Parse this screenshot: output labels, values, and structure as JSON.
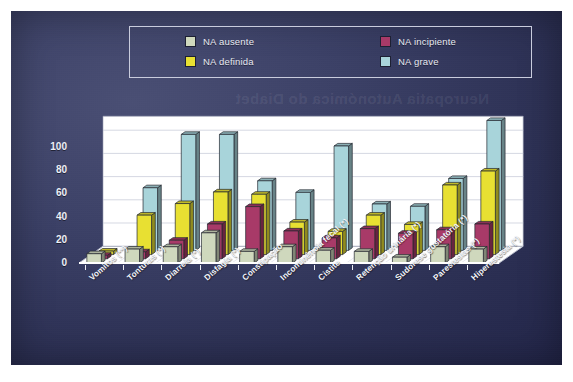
{
  "chart_data": {
    "type": "bar",
    "title": "",
    "xlabel": "",
    "ylabel": "",
    "ylim": [
      0,
      100
    ],
    "yticks": [
      0,
      20,
      40,
      60,
      80,
      100
    ],
    "grid": true,
    "legend_position": "top",
    "style": "3d-grouped-bar",
    "categories": [
      "Vomitos (**)",
      "Tonturas (*)",
      "Diarreia (*)",
      "Disfagia (*)",
      "Constipação",
      "Incontinência fecal (*)",
      "Cistite",
      "Retenção urinária (*)",
      "Sudorese gustatória (*)",
      "Parestesias (*)",
      "Hiperestesia (*)"
    ],
    "series": [
      {
        "name": "NA ausente",
        "color": "#cfd8bd",
        "values": [
          8,
          12,
          14,
          26,
          10,
          14,
          11,
          10,
          5,
          14,
          12
        ]
      },
      {
        "name": "NA incipiente",
        "color": "#a83a68",
        "values": [
          3,
          6,
          16,
          30,
          45,
          24,
          18,
          26,
          22,
          25,
          30
        ]
      },
      {
        "name": "NA definida",
        "color": "#e8e032",
        "values": [
          3,
          34,
          44,
          54,
          52,
          28,
          20,
          34,
          26,
          60,
          72
        ]
      },
      {
        "name": "NA grave",
        "color": "#a8d4da",
        "values": [
          0,
          54,
          100,
          100,
          60,
          50,
          90,
          40,
          38,
          62,
          112
        ]
      }
    ]
  },
  "legend": {
    "items": [
      {
        "label": "NA ausente",
        "color": "#cfd8bd"
      },
      {
        "label": "NA definida",
        "color": "#e8e032"
      },
      {
        "label": "NA incipiente",
        "color": "#a83a68"
      },
      {
        "label": "NA grave",
        "color": "#a8d4da"
      }
    ]
  },
  "ghost_text": "Neuropatia Autonómica do Diabet"
}
